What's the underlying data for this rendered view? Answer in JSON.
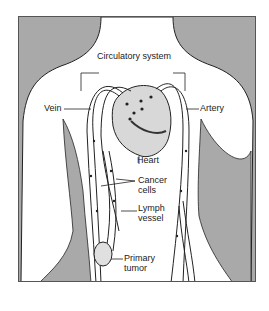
{
  "diagram": {
    "title": "Circulatory system",
    "labels": {
      "vein": "Vein",
      "artery": "Artery",
      "heart": "Heart",
      "cancer_cells_line1": "Cancer",
      "cancer_cells_line2": "cells",
      "lymph_vessel_line1": "Lymph",
      "lymph_vessel_line2": "vessel",
      "primary_tumor_line1": "Primary",
      "primary_tumor_line2": "tumor"
    },
    "colors": {
      "background": "#a9a9a9",
      "body": "#ffffff",
      "outline": "#222222"
    }
  }
}
